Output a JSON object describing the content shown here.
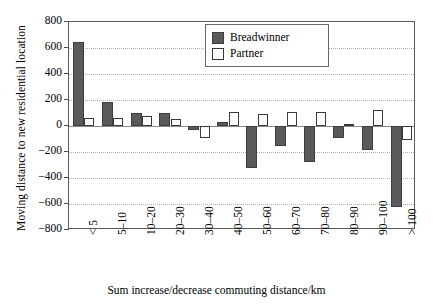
{
  "chart_data": {
    "type": "bar",
    "title": "",
    "xlabel": "Sum increase/decrease commuting distance/km",
    "ylabel": "Moving distance to new residential location",
    "categories": [
      "< 5",
      "5–10",
      "10–20",
      "20–30",
      "30–40",
      "40–50",
      "50–60",
      "60–70",
      "70–80",
      "80–90",
      "90–100",
      "> 100"
    ],
    "series": [
      {
        "name": "Breadwinner",
        "color": "#5a5a5a",
        "values": [
          650,
          185,
          100,
          100,
          -30,
          30,
          -320,
          -150,
          -275,
          -95,
          -185,
          -620
        ]
      },
      {
        "name": "Partner",
        "color": "#ffffff",
        "values": [
          65,
          65,
          80,
          55,
          -95,
          110,
          90,
          105,
          110,
          15,
          120,
          -110
        ]
      }
    ],
    "ylim": [
      -800,
      800
    ],
    "yticks": [
      800,
      600,
      400,
      200,
      0,
      -200,
      -400,
      -600,
      -800
    ],
    "ytick_labels": [
      "800",
      "600",
      "400",
      "200",
      "0",
      "−200",
      "−400",
      "−600",
      "−800"
    ],
    "grid": true,
    "legend_position": "top-right"
  },
  "legend": {
    "items": [
      {
        "label": "Breadwinner",
        "style": "bw"
      },
      {
        "label": "Partner",
        "style": "pt"
      }
    ]
  }
}
